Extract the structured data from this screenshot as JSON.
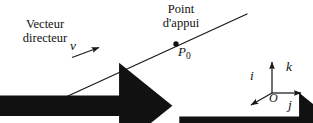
{
  "figure": {
    "background_color": "#ffffff",
    "stroke_color": "#1a1a1a"
  },
  "labels": {
    "vecteur_line1": "Vecteur",
    "vecteur_line2": "directeur",
    "point_line1": "Point",
    "point_line2": "d'appui",
    "direction_vector": "v",
    "point_name": "P",
    "point_subscript": "0",
    "line_name": "Δ",
    "axis_i": "i",
    "axis_j": "j",
    "axis_k": "k",
    "origin": "O"
  },
  "geometry": {
    "line_delta": {
      "x1": 33,
      "y1": 112,
      "x2": 247,
      "y2": 14
    },
    "point_p0": {
      "cx": 176,
      "cy": 44,
      "r": 2.6
    },
    "vector_v_arrow": {
      "x1": 72,
      "y1": 57,
      "x2": 101,
      "y2": 46
    },
    "frame_origin": {
      "x": 272,
      "y": 93
    },
    "axis_k_tip": {
      "x": 272,
      "y": 60
    },
    "axis_j_tip": {
      "x": 303,
      "y": 93
    },
    "axis_i_tip": {
      "x": 249,
      "y": 107
    }
  }
}
